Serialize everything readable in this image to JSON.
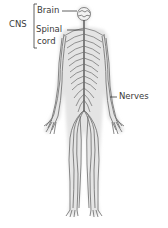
{
  "diagram": {
    "labels": {
      "cns": "CNS",
      "brain": "Brain",
      "spinal_line1": "Spinal",
      "spinal_line2": "cord",
      "nerves": "Nerves"
    },
    "colors": {
      "nerve": "#6b6b6b",
      "body_halo": "#e6e6e6",
      "text": "#3a3a3a",
      "leader": "#3a3a3a"
    }
  }
}
